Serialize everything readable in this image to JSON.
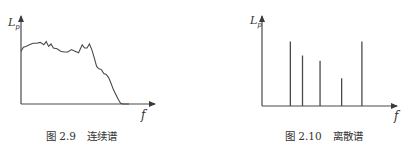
{
  "chart_data": [
    {
      "type": "line",
      "title": "图 2.9　连续谱",
      "caption_num": "图 2.9",
      "caption_text": "连续谱",
      "xlabel": "f",
      "ylabel": "L",
      "ylabel_sub": "p",
      "xlim": [
        0,
        100
      ],
      "ylim": [
        0,
        100
      ],
      "grid": false,
      "x": [
        0,
        2,
        4,
        7,
        10,
        13,
        16,
        19,
        21,
        23,
        25,
        27,
        30,
        33,
        36,
        39,
        42,
        45,
        48,
        51,
        53,
        55,
        57,
        59,
        61,
        63,
        65,
        67,
        69,
        71,
        73,
        75,
        77,
        79,
        81,
        83,
        85,
        87,
        89,
        90
      ],
      "values": [
        66,
        71,
        72,
        74,
        76,
        76,
        77,
        74,
        78,
        72,
        75,
        70,
        69,
        66,
        65,
        65,
        68,
        66,
        64,
        74,
        70,
        70,
        75,
        68,
        58,
        47,
        44,
        43,
        38,
        37,
        33,
        26,
        18,
        12,
        6,
        1,
        0,
        0,
        0,
        0
      ]
    },
    {
      "type": "bar",
      "title": "图 2.10　离散谱",
      "caption_num": "图 2.10",
      "caption_text": "离散谱",
      "xlabel": "f",
      "ylabel": "L",
      "ylabel_sub": "p",
      "xlim": [
        0,
        100
      ],
      "ylim": [
        0,
        100
      ],
      "grid": false,
      "x": [
        21,
        30,
        43,
        59,
        74
      ],
      "values": [
        74,
        58,
        52,
        32,
        74
      ]
    }
  ]
}
